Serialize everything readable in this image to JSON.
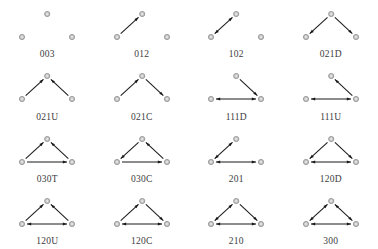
{
  "figure": {
    "title": "",
    "columns": 4,
    "rows": 4,
    "node_fill": "#c8c8c8",
    "node_stroke": "#8c8c8c",
    "node_inner": "#e8e8e8",
    "edge_color": "#1a1a1a",
    "label_color": "#3c3c3c",
    "background": "#ffffff",
    "node_positions": {
      "top": [
        47.2,
        14.0
      ],
      "bottom_left": [
        22.0,
        37.0
      ],
      "bottom_right": [
        72.0,
        37.0
      ]
    }
  },
  "triads": [
    {
      "label": "003",
      "edges": []
    },
    {
      "label": "012",
      "edges": [
        {
          "from": "bottom_left",
          "to": "top",
          "mutual": false
        }
      ]
    },
    {
      "label": "102",
      "edges": [
        {
          "from": "bottom_left",
          "to": "top",
          "mutual": true
        }
      ]
    },
    {
      "label": "021D",
      "edges": [
        {
          "from": "top",
          "to": "bottom_left",
          "mutual": false
        },
        {
          "from": "top",
          "to": "bottom_right",
          "mutual": false
        }
      ]
    },
    {
      "label": "021U",
      "edges": [
        {
          "from": "bottom_left",
          "to": "top",
          "mutual": false
        },
        {
          "from": "bottom_right",
          "to": "top",
          "mutual": false
        }
      ]
    },
    {
      "label": "021C",
      "edges": [
        {
          "from": "bottom_left",
          "to": "top",
          "mutual": false
        },
        {
          "from": "top",
          "to": "bottom_right",
          "mutual": false
        }
      ]
    },
    {
      "label": "111D",
      "edges": [
        {
          "from": "top",
          "to": "bottom_right",
          "mutual": false
        },
        {
          "from": "bottom_left",
          "to": "bottom_right",
          "mutual": true
        }
      ]
    },
    {
      "label": "111U",
      "edges": [
        {
          "from": "bottom_right",
          "to": "top",
          "mutual": false
        },
        {
          "from": "bottom_left",
          "to": "bottom_right",
          "mutual": true
        }
      ]
    },
    {
      "label": "030T",
      "edges": [
        {
          "from": "bottom_left",
          "to": "top",
          "mutual": false
        },
        {
          "from": "bottom_right",
          "to": "top",
          "mutual": false
        },
        {
          "from": "bottom_left",
          "to": "bottom_right",
          "mutual": false
        }
      ]
    },
    {
      "label": "030C",
      "edges": [
        {
          "from": "bottom_left",
          "to": "bottom_right",
          "mutual": false
        },
        {
          "from": "bottom_right",
          "to": "top",
          "mutual": false
        },
        {
          "from": "top",
          "to": "bottom_left",
          "mutual": false
        }
      ]
    },
    {
      "label": "201",
      "edges": [
        {
          "from": "bottom_left",
          "to": "top",
          "mutual": true
        },
        {
          "from": "bottom_left",
          "to": "bottom_right",
          "mutual": true
        }
      ]
    },
    {
      "label": "120D",
      "edges": [
        {
          "from": "top",
          "to": "bottom_left",
          "mutual": false
        },
        {
          "from": "top",
          "to": "bottom_right",
          "mutual": false
        },
        {
          "from": "bottom_left",
          "to": "bottom_right",
          "mutual": true
        }
      ]
    },
    {
      "label": "120U",
      "edges": [
        {
          "from": "bottom_left",
          "to": "top",
          "mutual": false
        },
        {
          "from": "bottom_right",
          "to": "top",
          "mutual": false
        },
        {
          "from": "bottom_left",
          "to": "bottom_right",
          "mutual": true
        }
      ]
    },
    {
      "label": "120C",
      "edges": [
        {
          "from": "bottom_left",
          "to": "top",
          "mutual": false
        },
        {
          "from": "top",
          "to": "bottom_right",
          "mutual": false
        },
        {
          "from": "bottom_left",
          "to": "bottom_right",
          "mutual": true
        }
      ]
    },
    {
      "label": "210",
      "edges": [
        {
          "from": "bottom_left",
          "to": "top",
          "mutual": true
        },
        {
          "from": "top",
          "to": "bottom_right",
          "mutual": false
        },
        {
          "from": "bottom_left",
          "to": "bottom_right",
          "mutual": true
        }
      ]
    },
    {
      "label": "300",
      "edges": [
        {
          "from": "bottom_left",
          "to": "top",
          "mutual": true
        },
        {
          "from": "top",
          "to": "bottom_right",
          "mutual": true
        },
        {
          "from": "bottom_left",
          "to": "bottom_right",
          "mutual": true
        }
      ]
    }
  ]
}
